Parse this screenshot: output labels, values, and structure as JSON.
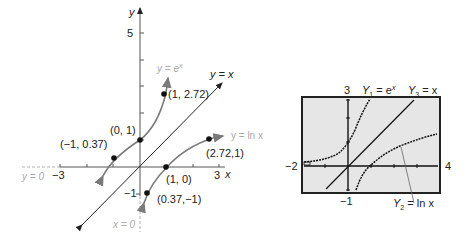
{
  "left_graph": {
    "axis_labels": {
      "x": "x",
      "y": "y"
    },
    "tick_labels": {
      "y_top": "5",
      "x_neg": "−3",
      "x_pos": "3",
      "y_neg": "−1"
    },
    "curve_labels": {
      "exp": "y = e",
      "exp_sup": "x",
      "identity": "y = x",
      "log": "y = ln x"
    },
    "asymptote_labels": {
      "horizontal": "y = 0",
      "vertical": "x = 0"
    },
    "points": [
      {
        "label": "(−1, 0.37)",
        "x": -1,
        "y": 0.37
      },
      {
        "label": "(0, 1)",
        "x": 0,
        "y": 1
      },
      {
        "label": "(1, 2.72)",
        "x": 1,
        "y": 2.72
      },
      {
        "label": "(2.72,1)",
        "x": 2.72,
        "y": 1
      },
      {
        "label": "(1, 0)",
        "x": 1,
        "y": 0
      },
      {
        "label": "(0.37,−1)",
        "x": 0.37,
        "y": -1
      }
    ]
  },
  "calculator_screen": {
    "window": {
      "xmin": "−2",
      "xmax": "4",
      "ymin": "−1",
      "ymax": "3"
    },
    "labels": {
      "y1": "Y",
      "y1_sub": "1",
      "y1_rhs": " = e",
      "y1_sup": "x",
      "y3": "Y",
      "y3_sub": "3",
      "y3_rhs": " = x",
      "y2": "Y",
      "y2_sub": "2",
      "y2_rhs": " = ln x"
    }
  },
  "colors": {
    "axis": "#555555",
    "curve": "#7a7a7a",
    "identity_line": "#222222",
    "dashed_asymptote": "#b0b0b0",
    "screen_bg": "#e6e6e6",
    "screen_border": "#222222"
  }
}
